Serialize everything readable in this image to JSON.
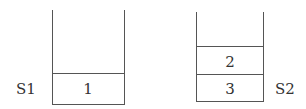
{
  "stacks": [
    {
      "label": "S1",
      "cells": [
        "1"
      ],
      "pop_indicator_faded": true
    },
    {
      "label": "S2",
      "cells": [
        "3",
        "2"
      ]
    }
  ],
  "colors": {
    "line": "#555555",
    "text": "#333333"
  }
}
